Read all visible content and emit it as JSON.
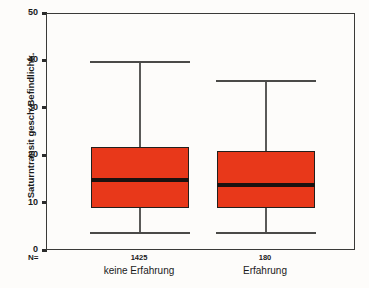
{
  "chart_data": {
    "type": "box",
    "title": "",
    "xlabel": "",
    "ylabel": "Saturntransit gesch.Befindlichk.",
    "ylim": [
      0,
      50
    ],
    "yticks": [
      0,
      10,
      20,
      30,
      40,
      50
    ],
    "ytick_labels": [
      "0",
      "10",
      "20",
      "30",
      "40",
      "50"
    ],
    "grid": false,
    "legend": null,
    "n_label": "N=",
    "categories": [
      "keine Erfahrung",
      "Erfahrung"
    ],
    "counts": [
      "1425",
      "180"
    ],
    "boxes": [
      {
        "category": "keine Erfahrung",
        "n": "1425",
        "whisker_low": 4,
        "q1": 9,
        "median": 15,
        "q3": 22,
        "whisker_high": 40
      },
      {
        "category": "Erfahrung",
        "n": "180",
        "whisker_low": 4,
        "q1": 9,
        "median": 14,
        "q3": 21,
        "whisker_high": 36
      }
    ],
    "colors": {
      "box_fill": "#e8381a",
      "box_edge": "#231f1c",
      "median": "#1a1210",
      "whisker": "#5a5a58",
      "frame": "#3a3a38",
      "background": "#fdfcfa",
      "text": "#1a1a1a"
    }
  }
}
